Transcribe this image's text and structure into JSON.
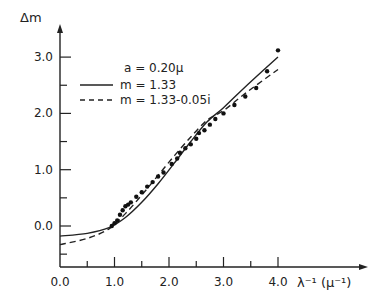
{
  "chart_data": {
    "type": "line",
    "title": "",
    "xlabel": "λ⁻¹ (μ⁻¹)",
    "ylabel": "Δm",
    "xlim": [
      0.0,
      4.4
    ],
    "ylim": [
      -0.75,
      3.4
    ],
    "x_ticks": [
      "0.0",
      "1.0",
      "2.0",
      "3.0",
      "4.0"
    ],
    "y_ticks": [
      "0.0",
      "1.0",
      "2.0",
      "3.0"
    ],
    "grid": false,
    "legend_position": "upper-left",
    "annotation": "a = 0.20μ",
    "series": [
      {
        "name": "m = 1.33",
        "style": "solid",
        "x": [
          0.0,
          0.5,
          0.9,
          1.2,
          1.5,
          1.8,
          2.1,
          2.4,
          2.7,
          3.0,
          3.3,
          3.6,
          4.0
        ],
        "y": [
          -0.18,
          -0.13,
          -0.03,
          0.15,
          0.42,
          0.75,
          1.12,
          1.5,
          1.85,
          2.1,
          2.38,
          2.65,
          3.0
        ]
      },
      {
        "name": "m = 1.33-0.05i",
        "style": "dashed",
        "x": [
          0.0,
          0.5,
          0.9,
          1.2,
          1.5,
          1.8,
          2.1,
          2.4,
          2.7,
          3.0,
          3.3,
          3.6,
          4.0
        ],
        "y": [
          -0.33,
          -0.22,
          -0.05,
          0.22,
          0.55,
          0.9,
          1.25,
          1.58,
          1.88,
          2.05,
          2.28,
          2.5,
          2.78
        ]
      },
      {
        "name": "observed",
        "style": "points",
        "x": [
          0.95,
          1.0,
          1.05,
          1.1,
          1.15,
          1.2,
          1.25,
          1.3,
          1.4,
          1.5,
          1.6,
          1.7,
          1.8,
          1.9,
          2.05,
          2.15,
          2.2,
          2.3,
          2.4,
          2.5,
          2.55,
          2.65,
          2.75,
          2.85,
          3.0,
          3.2,
          3.4,
          3.6,
          3.8,
          4.0
        ],
        "y": [
          0.0,
          0.05,
          0.1,
          0.2,
          0.28,
          0.35,
          0.38,
          0.42,
          0.52,
          0.6,
          0.7,
          0.78,
          0.88,
          0.95,
          1.1,
          1.2,
          1.3,
          1.38,
          1.45,
          1.55,
          1.65,
          1.7,
          1.8,
          1.9,
          2.0,
          2.15,
          2.3,
          2.45,
          2.75,
          3.12
        ]
      }
    ]
  },
  "legend": {
    "annotation": "a = 0.20μ",
    "items": [
      "m = 1.33",
      "m = 1.33-0.05i"
    ]
  },
  "axes": {
    "ylabel": "Δm",
    "xlabel": "λ⁻¹ (μ⁻¹)"
  }
}
